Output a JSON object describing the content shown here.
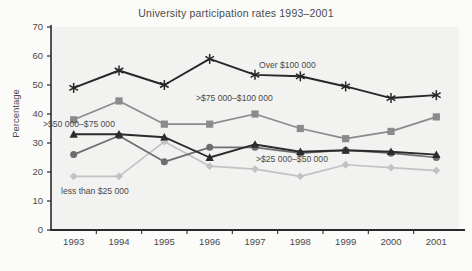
{
  "chart_data": {
    "type": "line",
    "title": "University participation rates 1993–2001",
    "xlabel": "",
    "ylabel": "Percentage",
    "categories": [
      "1993",
      "1994",
      "1995",
      "1996",
      "1997",
      "1998",
      "1999",
      "2000",
      "2001"
    ],
    "x": [
      1993,
      1994,
      1995,
      1996,
      1997,
      1998,
      1999,
      2000,
      2001
    ],
    "ylim": [
      0,
      70
    ],
    "yticks": [
      0,
      10,
      20,
      30,
      40,
      50,
      60,
      70
    ],
    "grid": false,
    "legend_position": "inline-annotations",
    "series": [
      {
        "name": "Over $100 000",
        "marker": "asterisk",
        "color": "#272727",
        "values": [
          49,
          55,
          50,
          59,
          53.5,
          53,
          49.5,
          45.5,
          46.5
        ]
      },
      {
        "name": ">$75 000–$100 000",
        "marker": "square",
        "color": "#8b8b8b",
        "values": [
          38,
          44.5,
          36.5,
          36.5,
          40,
          35,
          31.5,
          34,
          39
        ]
      },
      {
        "name": ">$50 000–$75 000",
        "marker": "triangle",
        "color": "#2b2b2b",
        "values": [
          33,
          33,
          32,
          25,
          29.5,
          27,
          27.5,
          27,
          26
        ]
      },
      {
        "name": ">$25 000–$50 000",
        "marker": "circle",
        "color": "#6e6e6e",
        "values": [
          26,
          32.5,
          23.5,
          28.5,
          28.5,
          26.5,
          27.5,
          26.5,
          25
        ]
      },
      {
        "name": "less than $25 000",
        "marker": "diamond",
        "color": "#c2c2c2",
        "values": [
          18.5,
          18.5,
          30.5,
          22,
          21,
          18.5,
          22.5,
          21.5,
          20.5
        ]
      }
    ],
    "annotations": [
      {
        "text": "Over $100 000",
        "series": "Over $100 000",
        "x_px": 259,
        "y_px": 68
      },
      {
        "text": ">$75 000–$100 000",
        "series": ">$75 000–$100 000",
        "x_px": 196,
        "y_px": 101
      },
      {
        "text": ">$50 000–$75 000",
        "series": ">$50 000–$75 000",
        "x_px": 43,
        "y_px": 127
      },
      {
        "text": ">$25 000–$50 000",
        "series": ">$25 000–$50 000",
        "x_px": 256,
        "y_px": 162
      },
      {
        "text": "less than $25 000",
        "series": "less than $25 000",
        "x_px": 61,
        "y_px": 194
      }
    ],
    "colors": {
      "over_100k": "#272727",
      "b75_100k": "#8b8b8b",
      "b50_75k": "#2b2b2b",
      "b25_50k": "#6e6e6e",
      "under_25k": "#c2c2c2",
      "axis": "#2a2a2a",
      "plot_background": "#f2f2f0",
      "page_background": "#fbfbfa"
    }
  }
}
